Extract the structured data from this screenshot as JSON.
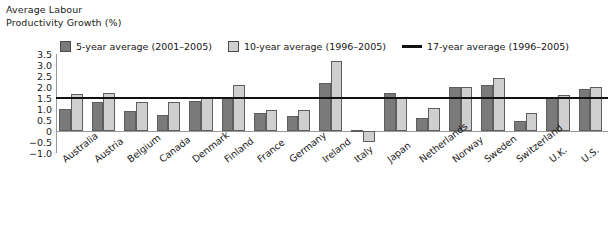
{
  "axis_title": {
    "line1": "Average Labour",
    "line2": "Productivity Growth (%)"
  },
  "legend": [
    {
      "key": "five",
      "label": "5-year average (2001–2005)",
      "marker": "square-dark",
      "color": "#7a7a7a"
    },
    {
      "key": "ten",
      "label": "10-year average (1996–2005)",
      "marker": "square-light",
      "color": "#cfcfcf"
    },
    {
      "key": "seventeen",
      "label": "17-year average (1996–2005)",
      "marker": "line",
      "color": "#111111"
    }
  ],
  "chart_data": {
    "type": "bar",
    "title": "",
    "xlabel": "",
    "ylabel": "Average Labour Productivity Growth (%)",
    "ylim": [
      -1.0,
      3.5
    ],
    "yticks": [
      "3.5",
      "3.0",
      "2.5",
      "2.0",
      "1.5",
      "1.0",
      "0.5",
      "0",
      "−0.5",
      "−1.0"
    ],
    "ytick_values": [
      3.5,
      3.0,
      2.5,
      2.0,
      1.5,
      1.0,
      0.5,
      0,
      -0.5,
      -1.0
    ],
    "grid": false,
    "legend_position": "top",
    "reference_line": {
      "label": "17-year average (1996–2005)",
      "value": 1.5,
      "color": "#111111"
    },
    "categories": [
      "Australia",
      "Austria",
      "Belgium",
      "Canada",
      "Denmark",
      "Finland",
      "France",
      "Germany",
      "Ireland",
      "Italy",
      "Japan",
      "Netherlands",
      "Norway",
      "Sweden",
      "Switzerland",
      "U.K.",
      "U.S."
    ],
    "series": [
      {
        "name": "5-year average (2001–2005)",
        "color": "#7a7a7a",
        "values": [
          1.0,
          1.3,
          0.9,
          0.75,
          1.35,
          1.5,
          0.8,
          0.7,
          2.2,
          0.05,
          1.75,
          0.6,
          2.0,
          2.1,
          0.45,
          1.5,
          1.9
        ]
      },
      {
        "name": "10-year average (1996–2005)",
        "color": "#cfcfcf",
        "values": [
          1.7,
          1.75,
          1.3,
          1.3,
          1.5,
          2.1,
          0.95,
          0.95,
          3.2,
          -0.5,
          1.5,
          1.05,
          2.0,
          2.4,
          0.8,
          1.65,
          2.0
        ]
      }
    ]
  }
}
